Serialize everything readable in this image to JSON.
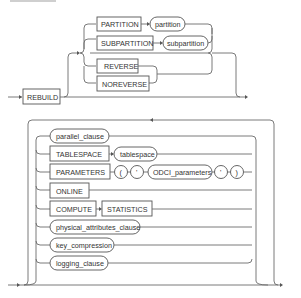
{
  "diagram": {
    "type": "railroad-syntax-diagram",
    "title_visible": false,
    "top": {
      "start_keyword": "REBUILD",
      "partition_branch": [
        {
          "keyword": "PARTITION",
          "param": "partition"
        },
        {
          "keyword": "SUBPARTITION",
          "param": "subpartition"
        }
      ],
      "reverse_branch": [
        {
          "keyword": "REVERSE"
        },
        {
          "keyword": "NOREVERSE"
        }
      ]
    },
    "bottom": {
      "options": [
        {
          "kind": "param",
          "label": "parallel_clause"
        },
        {
          "kind": "keyword",
          "label": "TABLESPACE",
          "param": "tablespace"
        },
        {
          "kind": "keyword",
          "label": "PARAMETERS",
          "seq": [
            "(",
            "'",
            "ODCI_parameters",
            "'",
            ")"
          ]
        },
        {
          "kind": "keyword",
          "label": "ONLINE"
        },
        {
          "kind": "keyword",
          "label": "COMPUTE",
          "next": "STATISTICS"
        },
        {
          "kind": "param",
          "label": "physical_attributes_clause"
        },
        {
          "kind": "param",
          "label": "key_compression"
        },
        {
          "kind": "param",
          "label": "logging_clause"
        }
      ]
    }
  }
}
